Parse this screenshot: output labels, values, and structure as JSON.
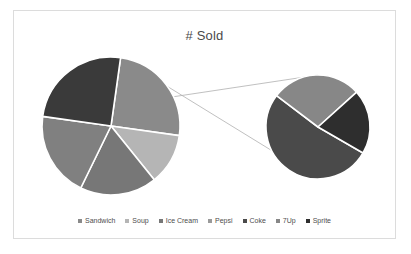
{
  "chart_data": {
    "type": "pie",
    "title": "# Sold",
    "variant": "pie-of-pie",
    "xlabel": "",
    "ylabel": "",
    "grid": false,
    "legend_position": "bottom",
    "categories": [
      "Sandwich",
      "Soup",
      "Ice Cream",
      "Pepsi",
      "Coke",
      "7Up",
      "Sprite"
    ],
    "values": [
      25,
      12,
      18,
      20,
      13,
      7,
      5
    ],
    "colors": [
      "#8a8a8a",
      "#b5b5b5",
      "#777777",
      "#808080",
      "#4a4a4a",
      "#878787",
      "#2e2e2e"
    ],
    "primary_pie": {
      "slices": [
        {
          "label": "Sandwich",
          "value": 25,
          "color": "#8a8a8a"
        },
        {
          "label": "Soup",
          "value": 12,
          "color": "#b5b5b5"
        },
        {
          "label": "Ice Cream",
          "value": 18,
          "color": "#777777"
        },
        {
          "label": "Pepsi",
          "value": 20,
          "color": "#808080"
        },
        {
          "label": "Other",
          "value": 25,
          "color": "#3a3a3a"
        }
      ]
    },
    "secondary_pie": {
      "slices": [
        {
          "label": "Coke",
          "value": 13,
          "color": "#4a4a4a"
        },
        {
          "label": "7Up",
          "value": 7,
          "color": "#878787"
        },
        {
          "label": "Sprite",
          "value": 5,
          "color": "#2e2e2e"
        }
      ]
    }
  },
  "legend": {
    "items": [
      {
        "label": "Sandwich",
        "color": "#8a8a8a"
      },
      {
        "label": "Soup",
        "color": "#b5b5b5"
      },
      {
        "label": "Ice Cream",
        "color": "#777777"
      },
      {
        "label": "Pepsi",
        "color": "#9a9a9a"
      },
      {
        "label": "Coke",
        "color": "#4a4a4a"
      },
      {
        "label": "7Up",
        "color": "#878787"
      },
      {
        "label": "Sprite",
        "color": "#2e2e2e"
      }
    ]
  },
  "style": {
    "background": "#ffffff",
    "frame_border": "#dcdcdc",
    "slice_border": "#ffffff",
    "connector": "#b0b0b0",
    "title_color": "#4a4a4a"
  }
}
